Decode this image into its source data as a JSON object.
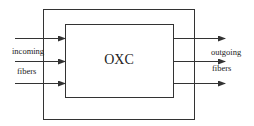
{
  "diagram": {
    "center_label": "OXC",
    "input_label_line1": "incoming",
    "input_label_line2": "fibers",
    "output_label_line1": "outgoing",
    "output_label_line2": "fibers",
    "input_arrow_count": 3,
    "output_arrow_count": 3
  },
  "colors": {
    "stroke": "#333333",
    "text": "#222222",
    "background": "#ffffff"
  }
}
